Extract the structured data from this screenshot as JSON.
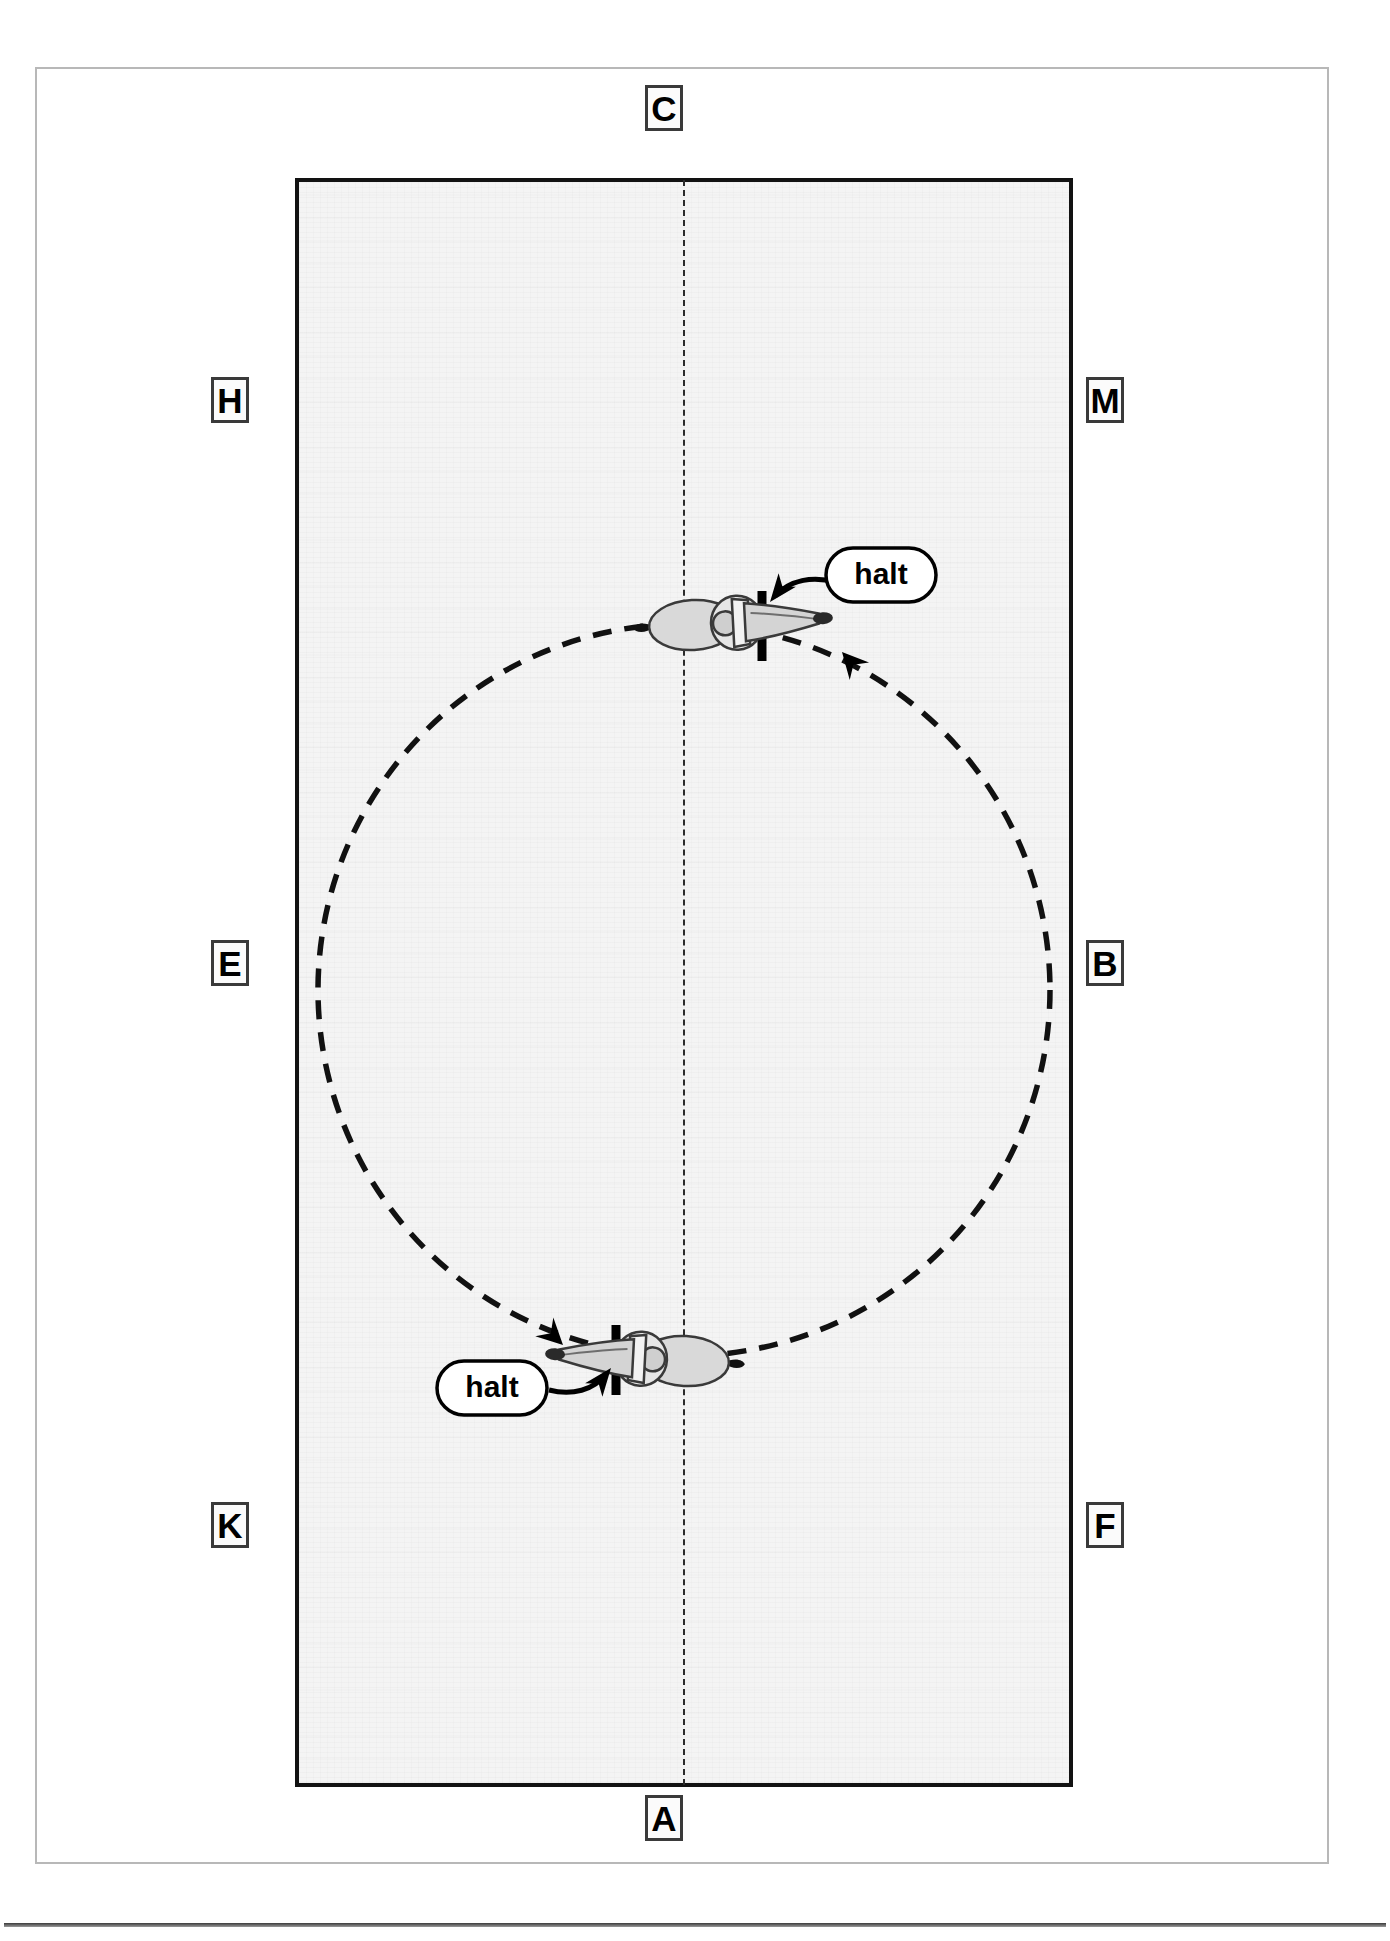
{
  "diagram": {
    "arena": {
      "shape": "rectangle",
      "centre_line_style": "dashed",
      "surface_color": "#f4f4f4",
      "border_color": "#121212"
    },
    "markers": [
      {
        "id": "marker-c",
        "letter": "C",
        "position": "top-centre",
        "x": 664,
        "y": 108
      },
      {
        "id": "marker-h",
        "letter": "H",
        "position": "left-upper",
        "x": 230,
        "y": 400
      },
      {
        "id": "marker-m",
        "letter": "M",
        "position": "right-upper",
        "x": 1105,
        "y": 400
      },
      {
        "id": "marker-e",
        "letter": "E",
        "position": "left-middle",
        "x": 230,
        "y": 963
      },
      {
        "id": "marker-b",
        "letter": "B",
        "position": "right-middle",
        "x": 1105,
        "y": 963
      },
      {
        "id": "marker-k",
        "letter": "K",
        "position": "left-lower",
        "x": 230,
        "y": 1525
      },
      {
        "id": "marker-f",
        "letter": "F",
        "position": "right-lower",
        "x": 1105,
        "y": 1525
      },
      {
        "id": "marker-a",
        "letter": "A",
        "position": "bottom-centre",
        "x": 664,
        "y": 1818
      }
    ],
    "figure": {
      "type": "circle",
      "style": "dashed",
      "centre_x": 684,
      "centre_y": 990,
      "radius": 366,
      "direction": "clockwise"
    },
    "halts": [
      {
        "id": "halt-top",
        "label": "halt",
        "bar_position": "top of circle, right of centre line",
        "horse_heading": "right",
        "pill_x": 770,
        "pill_y": 568
      },
      {
        "id": "halt-bottom",
        "label": "halt",
        "bar_position": "bottom of circle, left of centre line",
        "horse_heading": "left",
        "pill_x": 487,
        "pill_y": 1388
      }
    ],
    "colors": {
      "ink": "#000000",
      "arena_border": "#121212",
      "frame": "#b8b8b8",
      "surface": "#f4f4f4",
      "horse_body": "#d8d8d8"
    }
  }
}
